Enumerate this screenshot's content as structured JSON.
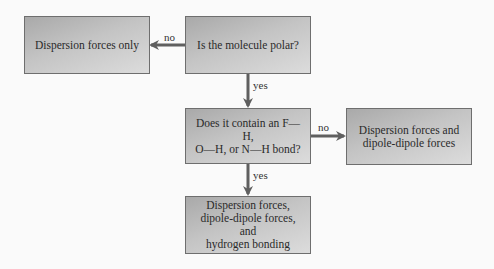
{
  "diagram": {
    "type": "flowchart",
    "nodes": {
      "start": {
        "text": "Is the molecule polar?"
      },
      "dispersion_only": {
        "text": "Dispersion forces only"
      },
      "hbond_question": {
        "text": "Does it contain an F—H,\nO—H, or N—H bond?"
      },
      "dipole_result": {
        "text": "Dispersion forces and\ndipole-dipole forces"
      },
      "hbond_result": {
        "text": "Dispersion forces,\ndipole-dipole forces, and\nhydrogen bonding"
      }
    },
    "edges": {
      "polar_no": {
        "label": "no",
        "from": "start",
        "to": "dispersion_only"
      },
      "polar_yes": {
        "label": "yes",
        "from": "start",
        "to": "hbond_question"
      },
      "hbond_no": {
        "label": "no",
        "from": "hbond_question",
        "to": "dipole_result"
      },
      "hbond_yes": {
        "label": "yes",
        "from": "hbond_question",
        "to": "hbond_result"
      }
    },
    "colors": {
      "box_fill_dark": "#a9a9a9",
      "box_fill_light": "#dcdcdc",
      "box_border": "#6e6e6e",
      "arrow": "#5f5f5f",
      "background": "#fafafa"
    }
  }
}
